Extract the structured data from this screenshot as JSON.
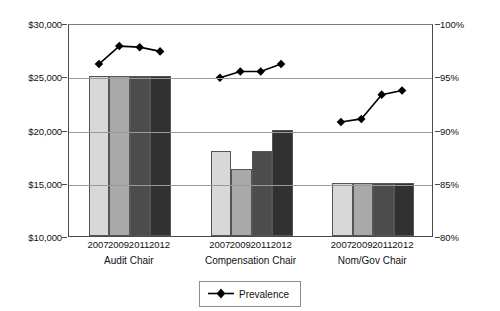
{
  "chart_data": {
    "type": "bar",
    "title": "",
    "xlabel": "",
    "ylabel": "",
    "grid": true,
    "legend_position": "bottom-center",
    "categories": [
      "2007",
      "2009",
      "2011",
      "2012"
    ],
    "groups": [
      "Audit Chair",
      "Compensation Chair",
      "Nom/Gov Chair"
    ],
    "axes": {
      "left": {
        "label": "",
        "ylim": [
          10000,
          30000
        ],
        "ticks": [
          "$10,000",
          "$15,000",
          "$20,000",
          "$25,000",
          "$30,000"
        ],
        "tick_values": [
          10000,
          15000,
          20000,
          25000,
          30000
        ]
      },
      "right": {
        "label": "",
        "ylim": [
          80,
          100
        ],
        "ticks": [
          "80%",
          "85%",
          "90%",
          "95%",
          "100%"
        ],
        "tick_values": [
          80,
          85,
          90,
          95,
          100
        ]
      }
    },
    "bar_series": [
      {
        "name": "Audit Chair",
        "group": "Audit Chair",
        "categories": [
          "2007",
          "2009",
          "2011",
          "2012"
        ],
        "values": [
          25000,
          25000,
          25000,
          25000
        ]
      },
      {
        "name": "Compensation Chair",
        "group": "Compensation Chair",
        "categories": [
          "2007",
          "2009",
          "2011",
          "2012"
        ],
        "values": [
          18000,
          16250,
          18000,
          20000
        ]
      },
      {
        "name": "Nom/Gov Chair",
        "group": "Nom/Gov Chair",
        "categories": [
          "2007",
          "2009",
          "2011",
          "2012"
        ],
        "values": [
          15000,
          15000,
          15000,
          15000
        ]
      }
    ],
    "line_series": [
      {
        "name": "Prevalence",
        "axis": "right",
        "marker": "diamond",
        "color": "#000000",
        "group_values": [
          {
            "group": "Audit Chair",
            "categories": [
              "2007",
              "2009",
              "2011",
              "2012"
            ],
            "values": [
              96.3,
              98.0,
              97.9,
              97.5
            ]
          },
          {
            "group": "Compensation Chair",
            "categories": [
              "2007",
              "2009",
              "2011",
              "2012"
            ],
            "values": [
              95.0,
              95.6,
              95.6,
              96.3
            ]
          },
          {
            "group": "Nom/Gov Chair",
            "categories": [
              "2007",
              "2009",
              "2011",
              "2012"
            ],
            "values": [
              90.8,
              91.1,
              93.4,
              93.8
            ]
          }
        ]
      }
    ],
    "bar_colors": {
      "2007": "#d8d8d8",
      "2009": "#a9a9a9",
      "2011": "#4c4c4c",
      "2012": "#313131"
    }
  },
  "legend": {
    "entries": [
      {
        "label": "Prevalence",
        "marker": "diamond",
        "color": "#000000"
      }
    ]
  }
}
